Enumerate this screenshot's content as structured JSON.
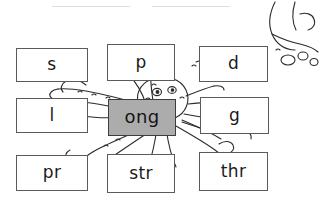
{
  "worksheet": {
    "title": "ong word family word building activity",
    "rime": {
      "id": "ong-rime",
      "label": "ong"
    },
    "rule_lines": 2,
    "colors": {
      "rime_fill": "#acacac",
      "card_fill": "#ffffff",
      "card_border": "#5a5a5a",
      "ink": "#1a1a1a",
      "rule_line": "#d9d9dd"
    },
    "illustration": {
      "name": "octopus-line-art",
      "description": "black-and-white outline drawing of an octopus with tentacles spreading behind the word cards"
    },
    "cards": [
      {
        "id": "s",
        "label": "s",
        "row": 1,
        "col": 1,
        "type": "onset"
      },
      {
        "id": "p",
        "label": "p",
        "row": 1,
        "col": 2,
        "type": "onset"
      },
      {
        "id": "d",
        "label": "d",
        "row": 1,
        "col": 3,
        "type": "onset"
      },
      {
        "id": "l",
        "label": "l",
        "row": 2,
        "col": 1,
        "type": "onset"
      },
      {
        "id": "ong",
        "label": "ong",
        "row": 2,
        "col": 2,
        "type": "rime"
      },
      {
        "id": "g",
        "label": "g",
        "row": 2,
        "col": 3,
        "type": "onset"
      },
      {
        "id": "pr",
        "label": "pr",
        "row": 3,
        "col": 1,
        "type": "blend"
      },
      {
        "id": "str",
        "label": "str",
        "row": 3,
        "col": 2,
        "type": "blend"
      },
      {
        "id": "thr",
        "label": "thr",
        "row": 3,
        "col": 3,
        "type": "blend"
      }
    ]
  }
}
